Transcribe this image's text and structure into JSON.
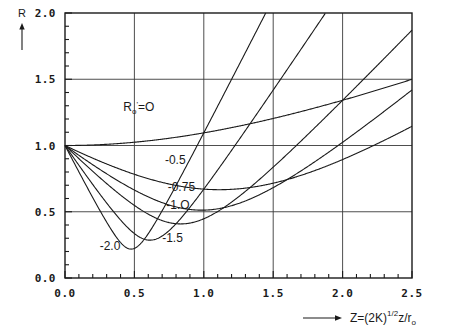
{
  "figure": {
    "y_axis_name": "R",
    "x_axis_expression": {
      "base": "Z=(2K)",
      "sup": "1/2",
      "mid": "z/r",
      "sub": "o"
    }
  },
  "chart_data": {
    "type": "line",
    "title": "",
    "subtitle": "",
    "xlabel": "Z=(2K)^1/2 z/r_o",
    "ylabel": "R",
    "xlim": [
      0.0,
      2.5
    ],
    "ylim": [
      0.0,
      2.0
    ],
    "xticks": [
      0.0,
      0.5,
      1.0,
      1.5,
      2.0,
      2.5
    ],
    "xtick_labels": [
      "0.0",
      "0.5",
      "1.0",
      "1.5",
      "2.0",
      "2.5"
    ],
    "yticks": [
      0.0,
      0.5,
      1.0,
      1.5,
      2.0
    ],
    "ytick_labels": [
      "0.0",
      "0.5",
      "1.0",
      "1.5",
      "2.0"
    ],
    "x_minor_tick_step": 0.1,
    "y_minor_tick_step": 0.1,
    "grid": true,
    "grid_axes": "both",
    "legend": "inline-curve-labels",
    "legend_position": "on-plot",
    "line_color": "#1a1a1a",
    "curve_formula": "R(Z) = sqrt((1 + R0p*Z)^2 + (0.447*Z)^2)",
    "series": [
      {
        "name": "R0p=0",
        "label": "R_o'=O",
        "R0p": 0.0,
        "label_x": 0.42,
        "label_y": 1.26,
        "x": [
          0.0,
          0.25,
          0.5,
          0.75,
          1.0,
          1.25,
          1.5,
          1.75,
          2.0,
          2.25,
          2.5
        ],
        "y": [
          1.0,
          1.006,
          1.024,
          1.055,
          1.095,
          1.144,
          1.2,
          1.262,
          1.329,
          1.4,
          1.5
        ]
      },
      {
        "name": "R0p=-0.5",
        "label": "-0.5",
        "R0p": -0.5,
        "label_x": 0.72,
        "label_y": 0.86,
        "x": [
          0.0,
          0.25,
          0.5,
          0.75,
          1.0,
          1.25,
          1.5,
          1.75,
          2.0,
          2.25,
          2.5
        ],
        "y": [
          1.0,
          0.886,
          0.799,
          0.746,
          0.731,
          0.754,
          0.81,
          0.893,
          0.995,
          1.111,
          1.237
        ]
      },
      {
        "name": "R0p=-0.75",
        "label": "-0.75",
        "R0p": -0.75,
        "label_x": 0.74,
        "label_y": 0.655,
        "x": [
          0.0,
          0.25,
          0.5,
          0.75,
          1.0,
          1.25,
          1.5,
          1.75,
          2.0,
          2.25,
          2.5
        ],
        "y": [
          1.0,
          0.829,
          0.692,
          0.608,
          0.593,
          0.645,
          0.747,
          0.879,
          1.03,
          1.192,
          1.36
        ]
      },
      {
        "name": "R0p=-1.0",
        "label": "-1.O",
        "R0p": -1.0,
        "label_x": 0.73,
        "label_y": 0.52,
        "x": [
          0.0,
          0.25,
          0.5,
          0.75,
          1.0,
          1.25,
          1.5,
          1.75,
          2.0,
          2.25,
          2.5
        ],
        "y": [
          1.0,
          0.775,
          0.595,
          0.457,
          0.447,
          0.561,
          0.747,
          0.971,
          1.216,
          1.473,
          1.739
        ]
      },
      {
        "name": "R0p=-1.5",
        "label": "-1.5",
        "R0p": -1.5,
        "label_x": 0.7,
        "label_y": 0.27,
        "x": [
          0.0,
          0.25,
          0.5,
          0.75,
          1.0,
          1.25,
          1.5,
          1.75,
          2.0
        ],
        "y": [
          1.0,
          0.676,
          0.373,
          0.183,
          0.547,
          0.949,
          1.363,
          1.784,
          2.207
        ]
      },
      {
        "name": "R0p=-2.0",
        "label": "-2.0",
        "R0p": -2.0,
        "label_x": 0.25,
        "label_y": 0.21,
        "x": [
          0.0,
          0.25,
          0.5,
          0.6,
          0.75,
          1.0,
          1.25,
          1.5
        ],
        "y": [
          1.0,
          0.587,
          0.224,
          0.279,
          0.598,
          1.119,
          1.649,
          2.182
        ]
      }
    ]
  }
}
